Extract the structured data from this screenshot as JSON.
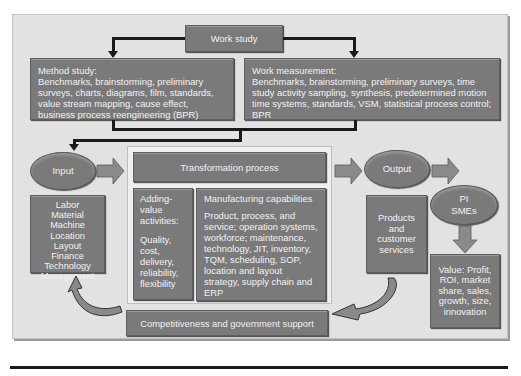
{
  "diagram": {
    "work_study": "Work study",
    "method_study": {
      "title": "Method study:",
      "body": "Benchmarks, brainstorming, preliminary surveys, charts, diagrams, film, standards, value stream mapping, cause effect, business process reengineering (BPR)"
    },
    "work_measurement": {
      "title": "Work measurement:",
      "body": "Benchmarks, brainstorming, preliminary surveys, time study activity sampling, synthesis, predetermined motion time systems, standards, VSM, statistical process control; BPR"
    },
    "input": {
      "label": "Input",
      "items": [
        "Labor",
        "Material",
        "Machine",
        "Location",
        "Layout",
        "Finance",
        "Technology",
        "Management"
      ]
    },
    "transformation": {
      "title": "Transformation process",
      "adding_value": {
        "title": "Adding-value activities:",
        "body": "Quality, cost, delivery, reliability, flexibility"
      },
      "manufacturing": {
        "title": "Manufacturing capabilities",
        "body": "Product, process, and service; operation systems, workforce; maintenance, technology, JIT, inventory, TQM, scheduling, SOP, location and layout strategy, supply chain and ERP"
      }
    },
    "output": {
      "label": "Output",
      "body": "Products and customer services"
    },
    "pi_smes": {
      "line1": "PI",
      "line2": "SMEs"
    },
    "value": {
      "body": "Value: Profit, ROI, market share, sales, growth, size, innovation"
    },
    "support": "Competitiveness and government support",
    "colors": {
      "box_fill": "#7a7a7a",
      "box_text": "#f2f2f2",
      "panel_bg": "#e2e2e2",
      "connector": "#1a1a1a",
      "block_arrow": "#8a8a8a"
    }
  }
}
